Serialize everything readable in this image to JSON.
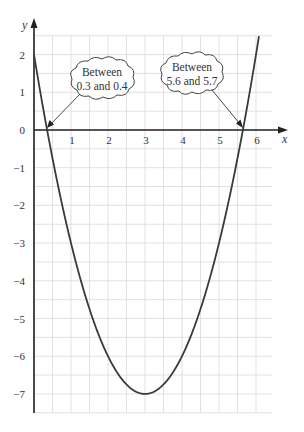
{
  "chart_data": {
    "type": "line",
    "title": "",
    "xlabel": "x",
    "ylabel": "y",
    "xlim": [
      0,
      6.5
    ],
    "ylim": [
      -7.5,
      2.5
    ],
    "grid": true,
    "grid_minor_step": 0.5,
    "x_ticks": [
      "1",
      "2",
      "3",
      "4",
      "5",
      "6"
    ],
    "y_ticks": [
      "2",
      "1",
      "0",
      "−1",
      "−2",
      "−3",
      "−4",
      "−5",
      "−6",
      "−7"
    ],
    "series": [
      {
        "name": "y = (x − 3)² − 7",
        "x": [
          0,
          0.354,
          0.5,
          1,
          1.5,
          2,
          2.5,
          3,
          3.5,
          4,
          4.5,
          5,
          5.5,
          5.646,
          6,
          6.2
        ],
        "values": [
          2,
          0,
          -0.75,
          -3,
          -4.75,
          -6,
          -6.75,
          -7,
          -6.75,
          -6,
          -4.75,
          -3,
          -0.75,
          0,
          2,
          3.24
        ]
      }
    ],
    "annotations": [
      {
        "text_line1": "Between",
        "text_line2": "0.3 and 0.4",
        "points_to": [
          0.35,
          0
        ]
      },
      {
        "text_line1": "Between",
        "text_line2": "5.6 and 5.7",
        "points_to": [
          5.65,
          0
        ]
      }
    ],
    "minimum": {
      "x": 3,
      "y": -7
    }
  },
  "colors": {
    "grid": "#d9d9d9",
    "axis": "#222222",
    "curve": "#3a3a3a",
    "text": "#333333"
  }
}
